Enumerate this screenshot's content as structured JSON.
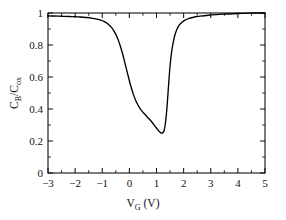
{
  "chart_data": {
    "type": "line",
    "title": "",
    "xlabel": "V_G (V)",
    "xlabel_main": "V",
    "xlabel_sub": "G",
    "xlabel_unit": "(V)",
    "ylabel": "C_B/C_ox",
    "ylabel_main_1": "C",
    "ylabel_sub_1": "B",
    "ylabel_slash": "/C",
    "ylabel_sub_2": "ox",
    "xlim": [
      -3,
      5
    ],
    "ylim": [
      0,
      1
    ],
    "x_major_ticks": [
      -3,
      -2,
      -1,
      0,
      1,
      2,
      3,
      4,
      5
    ],
    "x_major_tick_labels": [
      "−3",
      "−2",
      "−1",
      "0",
      "1",
      "2",
      "3",
      "4",
      "5"
    ],
    "x_minor_tick_step": 0.5,
    "y_major_ticks": [
      0,
      0.2,
      0.4,
      0.6,
      0.8,
      1
    ],
    "y_major_tick_labels": [
      "0",
      "0.2",
      "0.4",
      "0.6",
      "0.8",
      "1"
    ],
    "y_minor_tick_step": 0.1,
    "grid": false,
    "legend": false,
    "legend_position": "none",
    "curve_color": "#000000",
    "axis_color": "#111111",
    "background_color": "#ffffff",
    "series": [
      {
        "name": "C-V characteristic",
        "x": [
          -3.0,
          -2.8,
          -2.6,
          -2.4,
          -2.2,
          -2.0,
          -1.8,
          -1.6,
          -1.4,
          -1.2,
          -1.05,
          -0.9,
          -0.78,
          -0.66,
          -0.55,
          -0.45,
          -0.35,
          -0.25,
          -0.15,
          -0.05,
          0.05,
          0.15,
          0.25,
          0.35,
          0.45,
          0.55,
          0.65,
          0.75,
          0.85,
          0.95,
          1.02,
          1.08,
          1.12,
          1.16,
          1.2,
          1.24,
          1.28,
          1.32,
          1.36,
          1.4,
          1.45,
          1.5,
          1.56,
          1.62,
          1.7,
          1.8,
          1.9,
          2.05,
          2.2,
          2.4,
          2.6,
          2.9,
          3.2,
          3.6,
          4.0,
          4.4,
          4.7,
          5.0
        ],
        "y": [
          0.982,
          0.981,
          0.98,
          0.979,
          0.978,
          0.977,
          0.975,
          0.972,
          0.968,
          0.962,
          0.955,
          0.944,
          0.93,
          0.91,
          0.882,
          0.848,
          0.802,
          0.745,
          0.678,
          0.61,
          0.545,
          0.49,
          0.447,
          0.415,
          0.39,
          0.37,
          0.352,
          0.334,
          0.314,
          0.291,
          0.276,
          0.263,
          0.256,
          0.251,
          0.25,
          0.253,
          0.266,
          0.3,
          0.36,
          0.44,
          0.56,
          0.67,
          0.76,
          0.82,
          0.875,
          0.915,
          0.936,
          0.955,
          0.966,
          0.975,
          0.98,
          0.986,
          0.99,
          0.994,
          0.997,
          0.999,
          1.0,
          1.0
        ]
      }
    ]
  }
}
